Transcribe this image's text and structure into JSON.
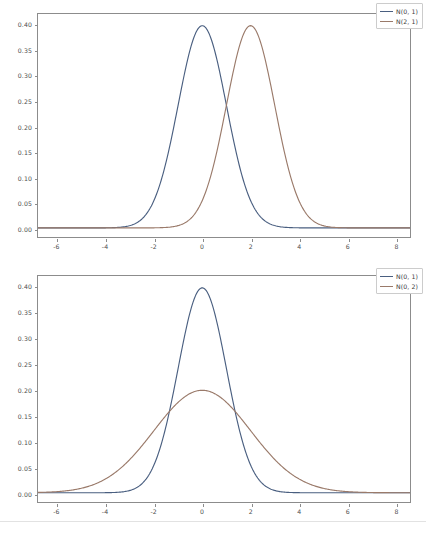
{
  "chart_data": [
    {
      "id": "top",
      "type": "line",
      "title": "",
      "xlabel": "",
      "ylabel": "",
      "xlim": [
        -6.8,
        8.6
      ],
      "ylim": [
        -0.018,
        0.422
      ],
      "xticks": [
        -6,
        -4,
        -2,
        0,
        2,
        4,
        6,
        8
      ],
      "xtick_labels": [
        "-6",
        "-4",
        "-2",
        "0",
        "2",
        "4",
        "6",
        "8"
      ],
      "yticks": [
        0.0,
        0.05,
        0.1,
        0.15,
        0.2,
        0.25,
        0.3,
        0.35,
        0.4
      ],
      "ytick_labels": [
        "0.00",
        "0.05",
        "0.10",
        "0.15",
        "0.20",
        "0.25",
        "0.30",
        "0.35",
        "0.40"
      ],
      "grid": false,
      "legend_position": "upper right",
      "series": [
        {
          "name": "N(0, 1)",
          "color": "#4a5f80",
          "mean": 0,
          "sigma": 1,
          "peak": 0.3989
        },
        {
          "name": "N(2, 1)",
          "color": "#9a7a6a",
          "mean": 2,
          "sigma": 1,
          "peak": 0.3989
        }
      ]
    },
    {
      "id": "bottom",
      "type": "line",
      "title": "",
      "xlabel": "",
      "ylabel": "",
      "xlim": [
        -6.8,
        8.6
      ],
      "ylim": [
        -0.018,
        0.422
      ],
      "xticks": [
        -6,
        -4,
        -2,
        0,
        2,
        4,
        6,
        8
      ],
      "xtick_labels": [
        "-6",
        "-4",
        "-2",
        "0",
        "2",
        "4",
        "6",
        "8"
      ],
      "yticks": [
        0.0,
        0.05,
        0.1,
        0.15,
        0.2,
        0.25,
        0.3,
        0.35,
        0.4
      ],
      "ytick_labels": [
        "0.00",
        "0.05",
        "0.10",
        "0.15",
        "0.20",
        "0.25",
        "0.30",
        "0.35",
        "0.40"
      ],
      "grid": false,
      "legend_position": "upper right",
      "series": [
        {
          "name": "N(0, 1)",
          "color": "#4a5f80",
          "mean": 0,
          "sigma": 1,
          "peak": 0.3989
        },
        {
          "name": "N(0, 2)",
          "color": "#9a7a6a",
          "mean": 0,
          "sigma": 2,
          "peak": 0.1995
        }
      ]
    }
  ],
  "figure": {
    "axes_edge_color": "#8c8c8c",
    "background": "#ffffff",
    "tick_label_color": "#4d4d4d"
  }
}
